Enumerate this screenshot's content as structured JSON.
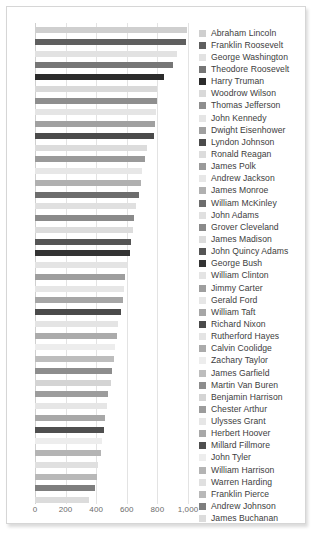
{
  "chart_data": {
    "type": "bar",
    "orientation": "horizontal",
    "title": "",
    "xlabel": "",
    "ylabel": "",
    "xlim": [
      0,
      1000
    ],
    "grid": true,
    "legend_position": "right",
    "xticks": [
      {
        "value": 0,
        "label": "0"
      },
      {
        "value": 200,
        "label": "200"
      },
      {
        "value": 400,
        "label": "400"
      },
      {
        "value": 600,
        "label": "600"
      },
      {
        "value": 800,
        "label": "800"
      },
      {
        "value": 1000,
        "label": "1,000"
      }
    ],
    "categories": [
      "Abraham Lincoln",
      "Franklin Roosevelt",
      "George Washington",
      "Theodore Roosevelt",
      "Harry Truman",
      "Woodrow Wilson",
      "Thomas Jefferson",
      "John Kennedy",
      "Dwight Eisenhower",
      "Lyndon Johnson",
      "Ronald Reagan",
      "James Polk",
      "Andrew Jackson",
      "James Monroe",
      "William McKinley",
      "John Adams",
      "Grover Cleveland",
      "James Madison",
      "John Quincy Adams",
      "George Bush",
      "William Clinton",
      "Jimmy Carter",
      "Gerald Ford",
      "William Taft",
      "Richard Nixon",
      "Rutherford Hayes",
      "Calvin Coolidge",
      "Zachary Taylor",
      "James Garfield",
      "Martin Van Buren",
      "Benjamin Harrison",
      "Chester Arthur",
      "Ulysses Grant",
      "Herbert Hoover",
      "Millard Fillmore",
      "John Tyler",
      "William Harrison",
      "Warren Harding",
      "Franklin Pierce",
      "Andrew Johnson",
      "James Buchanan"
    ],
    "values": [
      995,
      985,
      930,
      905,
      845,
      800,
      795,
      790,
      785,
      775,
      735,
      720,
      700,
      690,
      680,
      660,
      650,
      640,
      625,
      620,
      600,
      590,
      580,
      575,
      560,
      545,
      535,
      525,
      515,
      505,
      495,
      480,
      470,
      455,
      450,
      440,
      430,
      415,
      405,
      390,
      355
    ],
    "colors": [
      "#cfcfcf",
      "#5f5f5f",
      "#e2e2e2",
      "#767676",
      "#2b2b2b",
      "#d9d9d9",
      "#8e8e8e",
      "#e5e5e5",
      "#a0a0a0",
      "#4b4b4b",
      "#dcdcdc",
      "#9a9a9a",
      "#e7e7e7",
      "#b0b0b0",
      "#6d6d6d",
      "#e0e0e0",
      "#8a8a8a",
      "#dcdcdc",
      "#555555",
      "#333333",
      "#e4e4e4",
      "#9e9e9e",
      "#e6e6e6",
      "#a6a6a6",
      "#4a4a4a",
      "#e4e4e4",
      "#ababab",
      "#ededed",
      "#bdbdbd",
      "#8d8d8d",
      "#d4d4d4",
      "#9c9c9c",
      "#e6e6e6",
      "#a8a8a8",
      "#4f4f4f",
      "#ededed",
      "#b4b4b4",
      "#e0e0e0",
      "#b8b8b8",
      "#7e7e7e",
      "#dcdcdc"
    ]
  }
}
